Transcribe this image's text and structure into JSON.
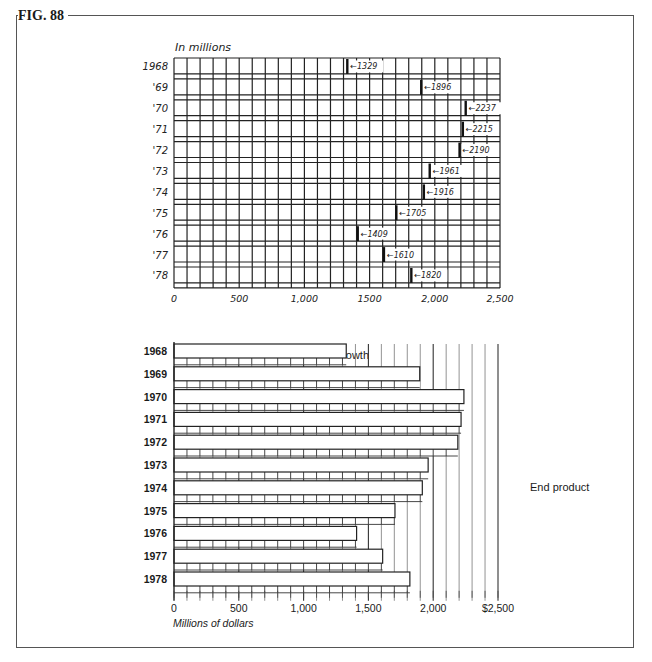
{
  "figure": {
    "label": "FIG. 88"
  },
  "chart_data": [
    {
      "id": "rough-sketch",
      "type": "bar",
      "orientation": "horizontal",
      "style": "hand-drawn grid sketch",
      "title": "",
      "unit_label": "In millions",
      "categories": [
        "1968",
        "'69",
        "'70",
        "'71",
        "'72",
        "'73",
        "'74",
        "'75",
        "'76",
        "'77",
        "'78"
      ],
      "values": [
        1329,
        1896,
        2237,
        2215,
        2190,
        1961,
        1916,
        1705,
        1409,
        1610,
        1820
      ],
      "annotations": [
        "1329",
        "1896",
        "2237",
        "2215",
        "2190",
        "1961",
        "1916",
        "1705",
        "1409",
        "1610",
        "1820"
      ],
      "x_ticks": [
        "0",
        "500",
        "1,000",
        "1500",
        "2,000",
        "2,500"
      ],
      "xlim": [
        0,
        2500
      ],
      "grid": true,
      "grid_step": 100
    },
    {
      "id": "end-product",
      "type": "bar",
      "orientation": "horizontal",
      "title": "Sales Growth",
      "categories": [
        "1968",
        "1969",
        "1970",
        "1971",
        "1972",
        "1973",
        "1974",
        "1975",
        "1976",
        "1977",
        "1978"
      ],
      "values": [
        1329,
        1896,
        2237,
        2215,
        2190,
        1961,
        1916,
        1705,
        1409,
        1610,
        1820
      ],
      "x_ticks": [
        "0",
        "500",
        "1,000",
        "1,500",
        "2,000",
        "$2,500"
      ],
      "xlabel": "Millions of dollars",
      "ylabel": "",
      "xlim": [
        0,
        2500
      ],
      "grid": true,
      "side_label": "End product"
    }
  ],
  "sketch": {
    "unit_label": "In millions",
    "rows": [
      {
        "year": "1968",
        "value": 1329,
        "note": "1329"
      },
      {
        "year": "'69",
        "value": 1896,
        "note": "1896"
      },
      {
        "year": "'70",
        "value": 2237,
        "note": "2237"
      },
      {
        "year": "'71",
        "value": 2215,
        "note": "2215"
      },
      {
        "year": "'72",
        "value": 2190,
        "note": "2190"
      },
      {
        "year": "'73",
        "value": 1961,
        "note": "1961"
      },
      {
        "year": "'74",
        "value": 1916,
        "note": "1916"
      },
      {
        "year": "'75",
        "value": 1705,
        "note": "1705"
      },
      {
        "year": "'76",
        "value": 1409,
        "note": "1409"
      },
      {
        "year": "'77",
        "value": 1610,
        "note": "1610"
      },
      {
        "year": "'78",
        "value": 1820,
        "note": "1820"
      }
    ],
    "ticks": [
      "0",
      "500",
      "1,000",
      "1500",
      "2,000",
      "2,500"
    ]
  },
  "final": {
    "title": "Sales Growth",
    "xlabel": "Millions of dollars",
    "side_label": "End product",
    "rows": [
      {
        "year": "1968",
        "value": 1329
      },
      {
        "year": "1969",
        "value": 1896
      },
      {
        "year": "1970",
        "value": 2237
      },
      {
        "year": "1971",
        "value": 2215
      },
      {
        "year": "1972",
        "value": 2190
      },
      {
        "year": "1973",
        "value": 1961
      },
      {
        "year": "1974",
        "value": 1916
      },
      {
        "year": "1975",
        "value": 1705
      },
      {
        "year": "1976",
        "value": 1409
      },
      {
        "year": "1977",
        "value": 1610
      },
      {
        "year": "1978",
        "value": 1820
      }
    ],
    "ticks": [
      "0",
      "500",
      "1,000",
      "1,500",
      "2,000",
      "$2,500"
    ]
  }
}
